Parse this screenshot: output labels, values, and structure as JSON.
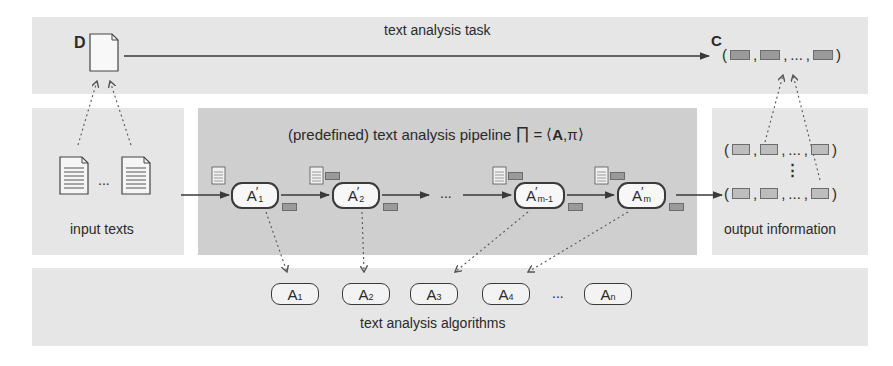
{
  "top_band": {
    "task_label": "text analysis task",
    "input_symbol": "D",
    "output_symbol": "C",
    "output_tuple": {
      "open": "(",
      "separator": ",",
      "ellipsis": "...",
      "close": ")"
    }
  },
  "input_panel": {
    "label": "input texts",
    "ellipsis": "..."
  },
  "pipeline_panel": {
    "title": "(predefined) text analysis pipeline",
    "formula": "∏ = ⟨A,π⟩",
    "formula_parts": {
      "pi": "∏",
      "eq": "=",
      "lang": "⟨",
      "A": "A",
      "comma": ",",
      "pi_small": "π",
      "rang": "⟩"
    },
    "ellipsis": "...",
    "stages": [
      {
        "base": "A",
        "prime": "′",
        "sub": "1"
      },
      {
        "base": "A",
        "prime": "′",
        "sub": "2"
      },
      {
        "base": "A",
        "prime": "′",
        "sub": "m-1"
      },
      {
        "base": "A",
        "prime": "′",
        "sub": "m"
      }
    ]
  },
  "output_panel": {
    "label": "output information",
    "vertical_ellipsis": "⋮",
    "tuple": {
      "open": "(",
      "separator": ",",
      "ellipsis": "...",
      "close": ")"
    }
  },
  "bottom_band": {
    "label": "text analysis algorithms",
    "ellipsis": "...",
    "algorithms": [
      {
        "base": "A",
        "sub": "1"
      },
      {
        "base": "A",
        "sub": "2"
      },
      {
        "base": "A",
        "sub": "3"
      },
      {
        "base": "A",
        "sub": "4"
      },
      {
        "base": "A",
        "sub": "n"
      }
    ]
  },
  "colors": {
    "light_panel": "#e6e6e6",
    "pipeline_panel": "#cfcfcf",
    "stroke": "#3a3a3a",
    "annotation": "#9a9a9a"
  }
}
